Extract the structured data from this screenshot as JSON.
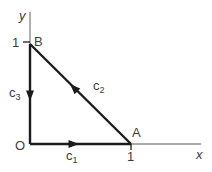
{
  "figure": {
    "background": "#ffffff",
    "colors": {
      "axis": "#8f8f8f",
      "path": "#1c1c1c",
      "text": "#3c3c3c"
    },
    "axes": {
      "x_label": "x",
      "y_label": "y"
    },
    "origin_label": "O",
    "points": {
      "a_label": "A",
      "b_label": "B"
    },
    "ticks": {
      "x_one": "1",
      "y_one": "1"
    },
    "curves": [
      {
        "name": "c1",
        "base": "c",
        "sub": "1",
        "direction": "O to A along x-axis"
      },
      {
        "name": "c2",
        "base": "c",
        "sub": "2",
        "direction": "A to B along hypotenuse"
      },
      {
        "name": "c3",
        "base": "c",
        "sub": "3",
        "direction": "B to O along y-axis"
      }
    ]
  }
}
